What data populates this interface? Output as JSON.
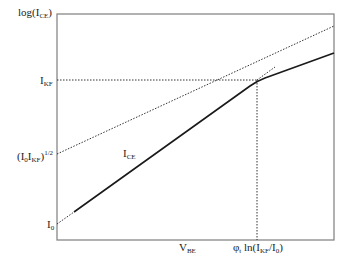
{
  "diagram": {
    "type": "semi-log transfer characteristic (Gummel-style) with high-injection knee",
    "y_axis": {
      "label_main": "log(I",
      "label_sub": "CE",
      "label_end": ")"
    },
    "y_ticks": [
      {
        "id": "ikf",
        "main": "I",
        "sub": "KF",
        "sup": ""
      },
      {
        "id": "sqrt",
        "main": "(I",
        "sub": "0",
        "main2": "I",
        "sub2": "KF",
        "main3": ")",
        "sup": "1/2"
      },
      {
        "id": "i0",
        "main": "I",
        "sub": "0",
        "sup": ""
      }
    ],
    "x_labels": [
      {
        "id": "vbe",
        "main": "V",
        "sub": "BE"
      },
      {
        "id": "knee",
        "main": "φ",
        "sub": "t",
        "main2": " ln(I",
        "sub2": "KF",
        "main3": "/I",
        "sub3": "0",
        "main4": ")"
      }
    ],
    "curve_label": {
      "main": "I",
      "sub": "CE"
    },
    "colors": {
      "line": "#1a1a1a",
      "frame": "#777777",
      "dotted": "#333333"
    }
  }
}
